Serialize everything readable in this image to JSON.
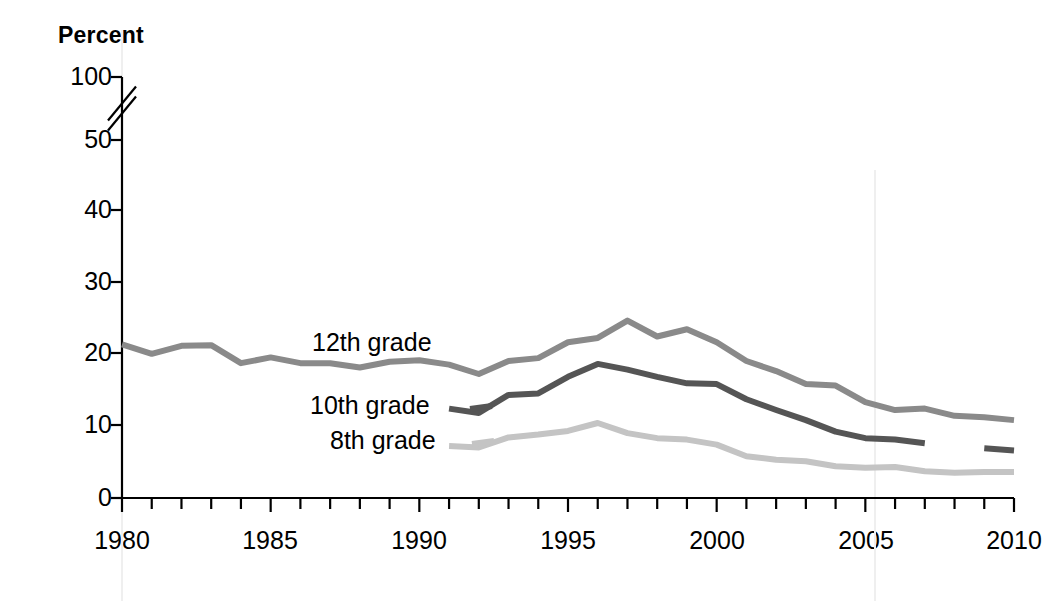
{
  "axis": {
    "y_title": "Percent",
    "y_ticks": [
      "100",
      "50",
      "40",
      "30",
      "20",
      "10",
      "0"
    ],
    "x_ticks": [
      "1980",
      "1985",
      "1990",
      "1995",
      "2000",
      "2005",
      "2010"
    ],
    "y_break_note": "axis-break-between-50-and-100"
  },
  "labels": {
    "grade12": "12th grade",
    "grade10": "10th grade",
    "grade8": "8th grade"
  },
  "colors": {
    "grade12": "#8a8a8a",
    "grade10": "#555555",
    "grade8": "#c4c4c4",
    "axis": "#000000",
    "background": "#ffffff"
  },
  "chart_data": {
    "type": "line",
    "title": "",
    "xlabel": "",
    "ylabel": "Percent",
    "xlim": [
      1980,
      2010
    ],
    "ylim": [
      0,
      50
    ],
    "grid": false,
    "legend": "inline-labels",
    "axis_break": {
      "from": 50,
      "to": 100
    },
    "x": [
      1980,
      1981,
      1982,
      1983,
      1984,
      1985,
      1986,
      1987,
      1988,
      1989,
      1990,
      1991,
      1992,
      1993,
      1994,
      1995,
      1996,
      1997,
      1998,
      1999,
      2000,
      2001,
      2002,
      2003,
      2004,
      2005,
      2006,
      2007,
      2008,
      2009,
      2010
    ],
    "series": [
      {
        "name": "12th grade",
        "color": "#8a8a8a",
        "points": [
          {
            "x": 1980,
            "y": 21.3
          },
          {
            "x": 1981,
            "y": 20.0
          },
          {
            "x": 1982,
            "y": 21.1
          },
          {
            "x": 1983,
            "y": 21.2
          },
          {
            "x": 1984,
            "y": 18.7
          },
          {
            "x": 1985,
            "y": 19.5
          },
          {
            "x": 1986,
            "y": 18.7
          },
          {
            "x": 1987,
            "y": 18.7
          },
          {
            "x": 1988,
            "y": 18.1
          },
          {
            "x": 1989,
            "y": 18.9
          },
          {
            "x": 1990,
            "y": 19.1
          },
          {
            "x": 1991,
            "y": 18.5
          },
          {
            "x": 1992,
            "y": 17.2
          },
          {
            "x": 1993,
            "y": 19.0
          },
          {
            "x": 1994,
            "y": 19.4
          },
          {
            "x": 1995,
            "y": 21.6
          },
          {
            "x": 1996,
            "y": 22.2
          },
          {
            "x": 1997,
            "y": 24.6
          },
          {
            "x": 1998,
            "y": 22.4
          },
          {
            "x": 1999,
            "y": 23.4
          },
          {
            "x": 2000,
            "y": 21.6
          },
          {
            "x": 2001,
            "y": 19.0
          },
          {
            "x": 2002,
            "y": 17.6
          },
          {
            "x": 2003,
            "y": 15.8
          },
          {
            "x": 2004,
            "y": 15.6
          },
          {
            "x": 2005,
            "y": 13.3
          },
          {
            "x": 2006,
            "y": 12.2
          },
          {
            "x": 2007,
            "y": 12.4
          },
          {
            "x": 2008,
            "y": 11.4
          },
          {
            "x": 2009,
            "y": 11.2
          },
          {
            "x": 2010,
            "y": 10.8
          }
        ]
      },
      {
        "name": "10th grade",
        "color": "#555555",
        "points": [
          {
            "x": 1991,
            "y": 12.4
          },
          {
            "x": 1992,
            "y": 11.8
          },
          {
            "x": 1993,
            "y": 14.3
          },
          {
            "x": 1994,
            "y": 14.5
          },
          {
            "x": 1995,
            "y": 16.8
          },
          {
            "x": 1996,
            "y": 18.6
          },
          {
            "x": 1997,
            "y": 17.8
          },
          {
            "x": 1998,
            "y": 16.8
          },
          {
            "x": 1999,
            "y": 15.9
          },
          {
            "x": 2000,
            "y": 15.8
          },
          {
            "x": 2001,
            "y": 13.7
          },
          {
            "x": 2002,
            "y": 12.2
          },
          {
            "x": 2003,
            "y": 10.8
          },
          {
            "x": 2004,
            "y": 9.2
          },
          {
            "x": 2005,
            "y": 8.3
          },
          {
            "x": 2006,
            "y": 8.1
          },
          {
            "x": 2007,
            "y": 7.6
          }
        ],
        "extra_segment": [
          {
            "x": 2009,
            "y": 6.9
          },
          {
            "x": 2010,
            "y": 6.6
          }
        ],
        "note": "line breaks after 2007; short separate segment near 2009-2010"
      },
      {
        "name": "8th grade",
        "color": "#c4c4c4",
        "points": [
          {
            "x": 1991,
            "y": 7.2
          },
          {
            "x": 1992,
            "y": 7.0
          },
          {
            "x": 1993,
            "y": 8.4
          },
          {
            "x": 1994,
            "y": 8.8
          },
          {
            "x": 1995,
            "y": 9.3
          },
          {
            "x": 1996,
            "y": 10.4
          },
          {
            "x": 1997,
            "y": 9.0
          },
          {
            "x": 1998,
            "y": 8.3
          },
          {
            "x": 1999,
            "y": 8.1
          },
          {
            "x": 2000,
            "y": 7.4
          },
          {
            "x": 2001,
            "y": 5.8
          },
          {
            "x": 2002,
            "y": 5.3
          },
          {
            "x": 2003,
            "y": 5.1
          },
          {
            "x": 2004,
            "y": 4.4
          },
          {
            "x": 2005,
            "y": 4.2
          },
          {
            "x": 2006,
            "y": 4.3
          },
          {
            "x": 2007,
            "y": 3.7
          },
          {
            "x": 2008,
            "y": 3.5
          },
          {
            "x": 2009,
            "y": 3.6
          },
          {
            "x": 2010,
            "y": 3.6
          }
        ]
      }
    ]
  },
  "geometry": {
    "plot_left": 122,
    "plot_right": 1014,
    "y_zero_px": 498,
    "y_per_unit_px": 7.21,
    "year_min": 1980,
    "year_max": 2010,
    "y_tick_px": {
      "100": 77,
      "50": 140,
      "40": 210,
      "30": 282,
      "20": 353,
      "10": 425,
      "0": 498
    },
    "x_label_px": {
      "1980": 122,
      "1985": 270,
      "1990": 419,
      "1995": 568,
      "2000": 717,
      "2005": 866,
      "2010": 1014
    },
    "label_positions": {
      "grade12": {
        "left": 312,
        "top": 330
      },
      "grade10": {
        "left": 310,
        "top": 393
      },
      "grade8": {
        "left": 330,
        "top": 428
      }
    }
  }
}
